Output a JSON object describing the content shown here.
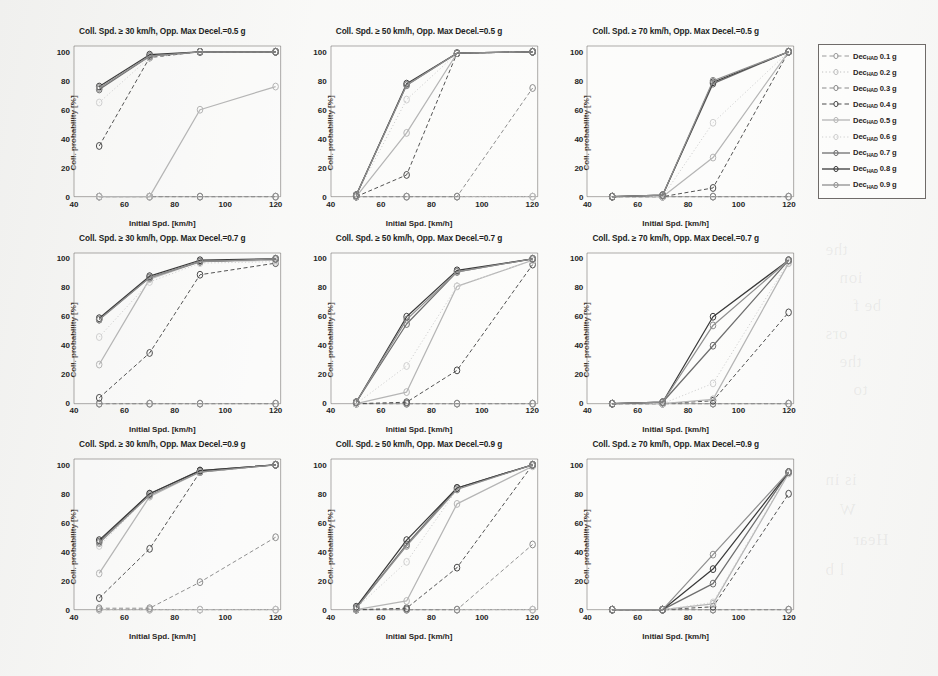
{
  "figure": {
    "axis_x": {
      "label": "Initial Spd. [km/h]",
      "ticks": [
        40,
        60,
        80,
        100,
        120
      ],
      "min": 40,
      "max": 122
    },
    "axis_y": {
      "label": "Coll. probability [%]",
      "ticks": [
        0,
        20,
        40,
        60,
        80,
        100
      ],
      "min": 0,
      "max": 104
    },
    "x_points": [
      50,
      70,
      90,
      120
    ]
  },
  "legend": {
    "prefix": "Dec",
    "subscript": "HAD",
    "items": [
      {
        "label": "Dec",
        "sub": "HAD",
        "value": "0.1 g",
        "style": "dashed",
        "color": "#9a9a9a"
      },
      {
        "label": "Dec",
        "sub": "HAD",
        "value": "0.2 g",
        "style": "dotted",
        "color": "#c0c0c0"
      },
      {
        "label": "Dec",
        "sub": "HAD",
        "value": "0.3 g",
        "style": "dashed",
        "color": "#8a8a8a"
      },
      {
        "label": "Dec",
        "sub": "HAD",
        "value": "0.4 g",
        "style": "dashed",
        "color": "#4a4a4a"
      },
      {
        "label": "Dec",
        "sub": "HAD",
        "value": "0.5 g",
        "style": "solid",
        "color": "#b5b5b5"
      },
      {
        "label": "Dec",
        "sub": "HAD",
        "value": "0.6 g",
        "style": "dotted",
        "color": "#cfcfcf"
      },
      {
        "label": "Dec",
        "sub": "HAD",
        "value": "0.7 g",
        "style": "solid",
        "color": "#6e6e6e"
      },
      {
        "label": "Dec",
        "sub": "HAD",
        "value": "0.8 g",
        "style": "solid",
        "color": "#3a3a3a"
      },
      {
        "label": "Dec",
        "sub": "HAD",
        "value": "0.9 g",
        "style": "solid",
        "color": "#8f8f8f"
      }
    ]
  },
  "chart_data": [
    {
      "type": "line",
      "id": "r1c1",
      "title": "Coll. Spd. ≥ 30 km/h, Opp. Max Decel.=0.5 g",
      "xlabel": "Initial Spd. [km/h]",
      "ylabel": "Coll. probability [%]",
      "xlim": [
        40,
        122
      ],
      "ylim": [
        0,
        104
      ],
      "xticks": [
        40,
        60,
        80,
        100,
        120
      ],
      "yticks": [
        0,
        20,
        40,
        60,
        80,
        100
      ],
      "grid": false,
      "x": [
        50,
        70,
        90,
        120
      ],
      "series": [
        {
          "name": "Dec_HAD 0.1 g",
          "values": [
            0,
            0,
            0,
            0
          ]
        },
        {
          "name": "Dec_HAD 0.2 g",
          "values": [
            0,
            0,
            0,
            0
          ]
        },
        {
          "name": "Dec_HAD 0.3 g",
          "values": [
            0,
            0,
            0,
            0
          ]
        },
        {
          "name": "Dec_HAD 0.4 g",
          "values": [
            35,
            96,
            100,
            100
          ]
        },
        {
          "name": "Dec_HAD 0.5 g",
          "values": [
            0,
            0,
            60,
            76
          ]
        },
        {
          "name": "Dec_HAD 0.6 g",
          "values": [
            65,
            96,
            100,
            100
          ]
        },
        {
          "name": "Dec_HAD 0.7 g",
          "values": [
            74,
            97,
            100,
            100
          ]
        },
        {
          "name": "Dec_HAD 0.8 g",
          "values": [
            76,
            98,
            100,
            100
          ]
        },
        {
          "name": "Dec_HAD 0.9 g",
          "values": [
            75,
            97,
            100,
            100
          ]
        }
      ]
    },
    {
      "type": "line",
      "id": "r1c2",
      "title": "Coll. Spd. ≥ 50 km/h, Opp. Max Decel.=0.5 g",
      "xlabel": "Initial Spd. [km/h]",
      "ylabel": "Coll. probability [%]",
      "xlim": [
        40,
        122
      ],
      "ylim": [
        0,
        104
      ],
      "xticks": [
        40,
        60,
        80,
        100,
        120
      ],
      "yticks": [
        0,
        20,
        40,
        60,
        80,
        100
      ],
      "grid": false,
      "x": [
        50,
        70,
        90,
        120
      ],
      "series": [
        {
          "name": "Dec_HAD 0.1 g",
          "values": [
            0,
            0,
            0,
            0
          ]
        },
        {
          "name": "Dec_HAD 0.2 g",
          "values": [
            0,
            0,
            0,
            0
          ]
        },
        {
          "name": "Dec_HAD 0.3 g",
          "values": [
            0,
            0,
            0,
            75
          ]
        },
        {
          "name": "Dec_HAD 0.4 g",
          "values": [
            0,
            15,
            99,
            100
          ]
        },
        {
          "name": "Dec_HAD 0.5 g",
          "values": [
            0,
            44,
            99,
            100
          ]
        },
        {
          "name": "Dec_HAD 0.6 g",
          "values": [
            1,
            67,
            99,
            100
          ]
        },
        {
          "name": "Dec_HAD 0.7 g",
          "values": [
            1,
            77,
            99,
            100
          ]
        },
        {
          "name": "Dec_HAD 0.8 g",
          "values": [
            1,
            78,
            99,
            100
          ]
        },
        {
          "name": "Dec_HAD 0.9 g",
          "values": [
            1,
            77,
            99,
            100
          ]
        }
      ]
    },
    {
      "type": "line",
      "id": "r1c3",
      "title": "Coll. Spd. ≥ 70 km/h, Opp. Max Decel.=0.5 g",
      "xlabel": "Initial Spd. [km/h]",
      "ylabel": "Coll. probability [%]",
      "xlim": [
        40,
        122
      ],
      "ylim": [
        0,
        104
      ],
      "xticks": [
        40,
        60,
        80,
        100,
        120
      ],
      "yticks": [
        0,
        20,
        40,
        60,
        80,
        100
      ],
      "grid": false,
      "x": [
        50,
        70,
        90,
        120
      ],
      "series": [
        {
          "name": "Dec_HAD 0.1 g",
          "values": [
            0,
            0,
            0,
            0
          ]
        },
        {
          "name": "Dec_HAD 0.2 g",
          "values": [
            0,
            0,
            0,
            0
          ]
        },
        {
          "name": "Dec_HAD 0.3 g",
          "values": [
            0,
            0,
            0,
            0
          ]
        },
        {
          "name": "Dec_HAD 0.4 g",
          "values": [
            0,
            0,
            6,
            100
          ]
        },
        {
          "name": "Dec_HAD 0.5 g",
          "values": [
            0,
            0,
            27,
            100
          ]
        },
        {
          "name": "Dec_HAD 0.6 g",
          "values": [
            0,
            0,
            51,
            100
          ]
        },
        {
          "name": "Dec_HAD 0.7 g",
          "values": [
            0,
            1,
            78,
            100
          ]
        },
        {
          "name": "Dec_HAD 0.8 g",
          "values": [
            0,
            1,
            79,
            100
          ]
        },
        {
          "name": "Dec_HAD 0.9 g",
          "values": [
            0,
            1,
            80,
            100
          ]
        }
      ]
    },
    {
      "type": "line",
      "id": "r2c1",
      "title": "Coll. Spd. ≥ 30 km/h, Opp. Max Decel.=0.7 g",
      "xlabel": "Initial Spd. [km/h]",
      "ylabel": "Coll. probability [%]",
      "xlim": [
        40,
        122
      ],
      "ylim": [
        0,
        104
      ],
      "xticks": [
        40,
        60,
        80,
        100,
        120
      ],
      "yticks": [
        0,
        20,
        40,
        60,
        80,
        100
      ],
      "grid": false,
      "x": [
        50,
        70,
        90,
        120
      ],
      "series": [
        {
          "name": "Dec_HAD 0.1 g",
          "values": [
            0,
            0,
            0,
            0
          ]
        },
        {
          "name": "Dec_HAD 0.2 g",
          "values": [
            0,
            0,
            0,
            0
          ]
        },
        {
          "name": "Dec_HAD 0.3 g",
          "values": [
            0,
            0,
            0,
            0
          ]
        },
        {
          "name": "Dec_HAD 0.4 g",
          "values": [
            4,
            35,
            89,
            97
          ]
        },
        {
          "name": "Dec_HAD 0.5 g",
          "values": [
            27,
            86,
            98,
            99
          ]
        },
        {
          "name": "Dec_HAD 0.6 g",
          "values": [
            46,
            84,
            97,
            98
          ]
        },
        {
          "name": "Dec_HAD 0.7 g",
          "values": [
            58,
            87,
            98,
            100
          ]
        },
        {
          "name": "Dec_HAD 0.8 g",
          "values": [
            59,
            88,
            99,
            100
          ]
        },
        {
          "name": "Dec_HAD 0.9 g",
          "values": [
            58,
            87,
            98,
            100
          ]
        }
      ]
    },
    {
      "type": "line",
      "id": "r2c2",
      "title": "Coll. Spd. ≥ 50 km/h, Opp. Max Decel.=0.7 g",
      "xlabel": "Initial Spd. [km/h]",
      "ylabel": "Coll. probability [%]",
      "xlim": [
        40,
        122
      ],
      "ylim": [
        0,
        104
      ],
      "xticks": [
        40,
        60,
        80,
        100,
        120
      ],
      "yticks": [
        0,
        20,
        40,
        60,
        80,
        100
      ],
      "grid": false,
      "x": [
        50,
        70,
        90,
        120
      ],
      "series": [
        {
          "name": "Dec_HAD 0.1 g",
          "values": [
            0,
            0,
            0,
            0
          ]
        },
        {
          "name": "Dec_HAD 0.2 g",
          "values": [
            0,
            0,
            0,
            0
          ]
        },
        {
          "name": "Dec_HAD 0.3 g",
          "values": [
            0,
            0,
            0,
            0
          ]
        },
        {
          "name": "Dec_HAD 0.4 g",
          "values": [
            0,
            1,
            23,
            96
          ]
        },
        {
          "name": "Dec_HAD 0.5 g",
          "values": [
            0,
            8,
            81,
            99
          ]
        },
        {
          "name": "Dec_HAD 0.6 g",
          "values": [
            0,
            26,
            81,
            99
          ]
        },
        {
          "name": "Dec_HAD 0.7 g",
          "values": [
            1,
            55,
            91,
            100
          ]
        },
        {
          "name": "Dec_HAD 0.8 g",
          "values": [
            1,
            60,
            92,
            100
          ]
        },
        {
          "name": "Dec_HAD 0.9 g",
          "values": [
            1,
            58,
            91,
            100
          ]
        }
      ]
    },
    {
      "type": "line",
      "id": "r2c3",
      "title": "Coll. Spd. ≥ 70 km/h, Opp. Max Decel.=0.7 g",
      "xlabel": "Initial Spd. [km/h]",
      "ylabel": "Coll. probability [%]",
      "xlim": [
        40,
        122
      ],
      "ylim": [
        0,
        104
      ],
      "xticks": [
        40,
        60,
        80,
        100,
        120
      ],
      "yticks": [
        0,
        20,
        40,
        60,
        80,
        100
      ],
      "grid": false,
      "x": [
        50,
        70,
        90,
        120
      ],
      "series": [
        {
          "name": "Dec_HAD 0.1 g",
          "values": [
            0,
            0,
            0,
            0
          ]
        },
        {
          "name": "Dec_HAD 0.2 g",
          "values": [
            0,
            0,
            0,
            0
          ]
        },
        {
          "name": "Dec_HAD 0.3 g",
          "values": [
            0,
            0,
            0,
            0
          ]
        },
        {
          "name": "Dec_HAD 0.4 g",
          "values": [
            0,
            0,
            2,
            63
          ]
        },
        {
          "name": "Dec_HAD 0.5 g",
          "values": [
            0,
            0,
            3,
            97
          ]
        },
        {
          "name": "Dec_HAD 0.6 g",
          "values": [
            0,
            0,
            14,
            98
          ]
        },
        {
          "name": "Dec_HAD 0.7 g",
          "values": [
            0,
            1,
            40,
            99
          ]
        },
        {
          "name": "Dec_HAD 0.8 g",
          "values": [
            0,
            1,
            60,
            99
          ]
        },
        {
          "name": "Dec_HAD 0.9 g",
          "values": [
            0,
            1,
            54,
            99
          ]
        }
      ]
    },
    {
      "type": "line",
      "id": "r3c1",
      "title": "Coll. Spd. ≥ 30 km/h, Opp. Max Decel.=0.9 g",
      "xlabel": "Initial Spd. [km/h]",
      "ylabel": "Coll. probability [%]",
      "xlim": [
        40,
        122
      ],
      "ylim": [
        0,
        104
      ],
      "xticks": [
        40,
        60,
        80,
        100,
        120
      ],
      "yticks": [
        0,
        20,
        40,
        60,
        80,
        100
      ],
      "grid": false,
      "x": [
        50,
        70,
        90,
        120
      ],
      "series": [
        {
          "name": "Dec_HAD 0.1 g",
          "values": [
            0,
            0,
            0,
            0
          ]
        },
        {
          "name": "Dec_HAD 0.2 g",
          "values": [
            0,
            0,
            0,
            0
          ]
        },
        {
          "name": "Dec_HAD 0.3 g",
          "values": [
            1,
            1,
            19,
            50
          ]
        },
        {
          "name": "Dec_HAD 0.4 g",
          "values": [
            8,
            42,
            95,
            100
          ]
        },
        {
          "name": "Dec_HAD 0.5 g",
          "values": [
            25,
            78,
            95,
            100
          ]
        },
        {
          "name": "Dec_HAD 0.6 g",
          "values": [
            44,
            79,
            95,
            100
          ]
        },
        {
          "name": "Dec_HAD 0.7 g",
          "values": [
            47,
            80,
            96,
            100
          ]
        },
        {
          "name": "Dec_HAD 0.8 g",
          "values": [
            48,
            80,
            96,
            100
          ]
        },
        {
          "name": "Dec_HAD 0.9 g",
          "values": [
            46,
            79,
            95,
            100
          ]
        }
      ]
    },
    {
      "type": "line",
      "id": "r3c2",
      "title": "Coll. Spd. ≥ 50 km/h, Opp. Max Decel.=0.9 g",
      "xlabel": "Initial Spd. [km/h]",
      "ylabel": "Coll. probability [%]",
      "xlim": [
        40,
        122
      ],
      "ylim": [
        0,
        104
      ],
      "xticks": [
        40,
        60,
        80,
        100,
        120
      ],
      "yticks": [
        0,
        20,
        40,
        60,
        80,
        100
      ],
      "grid": false,
      "x": [
        50,
        70,
        90,
        120
      ],
      "series": [
        {
          "name": "Dec_HAD 0.1 g",
          "values": [
            0,
            0,
            0,
            0
          ]
        },
        {
          "name": "Dec_HAD 0.2 g",
          "values": [
            0,
            0,
            0,
            0
          ]
        },
        {
          "name": "Dec_HAD 0.3 g",
          "values": [
            0,
            0,
            0,
            45
          ]
        },
        {
          "name": "Dec_HAD 0.4 g",
          "values": [
            0,
            1,
            29,
            100
          ]
        },
        {
          "name": "Dec_HAD 0.5 g",
          "values": [
            0,
            6,
            73,
            99
          ]
        },
        {
          "name": "Dec_HAD 0.6 g",
          "values": [
            1,
            33,
            83,
            100
          ]
        },
        {
          "name": "Dec_HAD 0.7 g",
          "values": [
            1,
            45,
            84,
            100
          ]
        },
        {
          "name": "Dec_HAD 0.8 g",
          "values": [
            2,
            48,
            84,
            100
          ]
        },
        {
          "name": "Dec_HAD 0.9 g",
          "values": [
            1,
            44,
            83,
            100
          ]
        }
      ]
    },
    {
      "type": "line",
      "id": "r3c3",
      "title": "Coll. Spd. ≥ 70 km/h, Opp. Max Decel.=0.9 g",
      "xlabel": "Initial Spd. [km/h]",
      "ylabel": "Coll. probability [%]",
      "xlim": [
        40,
        122
      ],
      "ylim": [
        0,
        104
      ],
      "xticks": [
        40,
        60,
        80,
        100,
        120
      ],
      "yticks": [
        0,
        20,
        40,
        60,
        80,
        100
      ],
      "grid": false,
      "x": [
        50,
        70,
        90,
        120
      ],
      "series": [
        {
          "name": "Dec_HAD 0.1 g",
          "values": [
            0,
            0,
            0,
            0
          ]
        },
        {
          "name": "Dec_HAD 0.2 g",
          "values": [
            0,
            0,
            0,
            0
          ]
        },
        {
          "name": "Dec_HAD 0.3 g",
          "values": [
            0,
            0,
            0,
            0
          ]
        },
        {
          "name": "Dec_HAD 0.4 g",
          "values": [
            0,
            0,
            2,
            80
          ]
        },
        {
          "name": "Dec_HAD 0.5 g",
          "values": [
            0,
            0,
            4,
            94
          ]
        },
        {
          "name": "Dec_HAD 0.6 g",
          "values": [
            0,
            0,
            5,
            95
          ]
        },
        {
          "name": "Dec_HAD 0.7 g",
          "values": [
            0,
            0,
            18,
            95
          ]
        },
        {
          "name": "Dec_HAD 0.8 g",
          "values": [
            0,
            0,
            28,
            95
          ]
        },
        {
          "name": "Dec_HAD 0.9 g",
          "values": [
            0,
            0,
            38,
            95
          ]
        }
      ]
    }
  ],
  "background_ghost_lines": [
    "the ",
    "ion ",
    "be f",
    "ors",
    "the",
    "to ",
    "is in",
    "W",
    "Hear",
    "l b"
  ]
}
